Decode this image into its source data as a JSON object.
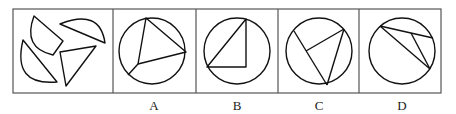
{
  "puzzle": {
    "description": "Which figure can be formed by assembling the four pieces?",
    "pieces_panel": {
      "pieces": [
        "circular-sector-piece",
        "semicircle-segment-piece",
        "circular-segment-piece",
        "triangle-piece"
      ]
    },
    "options": [
      {
        "label": "A",
        "figure": "circle with inscribed triangle and extra chord"
      },
      {
        "label": "B",
        "figure": "circle with inscribed right triangle"
      },
      {
        "label": "C",
        "figure": "circle with chords forming triangle-like partition"
      },
      {
        "label": "D",
        "figure": "circle with chords meeting at interior point"
      }
    ]
  }
}
